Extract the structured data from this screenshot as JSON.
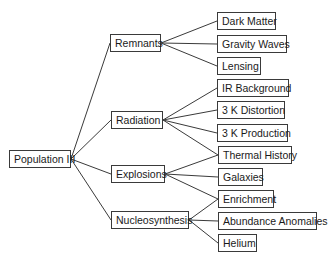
{
  "diagram": {
    "type": "tree",
    "root": {
      "id": "pop3",
      "label": "Population III"
    },
    "nodes": [
      {
        "id": "pop3",
        "label": "Population III",
        "x": 9,
        "y": 150,
        "w": 62
      },
      {
        "id": "remnants",
        "label": "Remnants",
        "x": 110,
        "y": 34,
        "w": 51
      },
      {
        "id": "radiation",
        "label": "Radiation",
        "x": 111,
        "y": 111,
        "w": 52
      },
      {
        "id": "explosions",
        "label": "Explosions",
        "x": 111,
        "y": 165,
        "w": 54
      },
      {
        "id": "nucleosynthesis",
        "label": "Nucleosynthesis",
        "x": 111,
        "y": 211,
        "w": 78
      },
      {
        "id": "dark_matter",
        "label": "Dark Matter",
        "x": 217,
        "y": 12,
        "w": 59
      },
      {
        "id": "gravity_waves",
        "label": "Gravity Waves",
        "x": 217,
        "y": 35,
        "w": 70
      },
      {
        "id": "lensing",
        "label": "Lensing",
        "x": 217,
        "y": 57,
        "w": 44
      },
      {
        "id": "ir_background",
        "label": "IR Background",
        "x": 217,
        "y": 79,
        "w": 72
      },
      {
        "id": "k3_distortion",
        "label": "3 K Distortion",
        "x": 217,
        "y": 101,
        "w": 68
      },
      {
        "id": "k3_production",
        "label": "3 K Production",
        "x": 217,
        "y": 124,
        "w": 71
      },
      {
        "id": "thermal_history",
        "label": "Thermal History",
        "x": 218,
        "y": 146,
        "w": 74
      },
      {
        "id": "galaxies",
        "label": "Galaxies",
        "x": 218,
        "y": 168,
        "w": 45
      },
      {
        "id": "enrichment",
        "label": "Enrichment",
        "x": 218,
        "y": 190,
        "w": 56
      },
      {
        "id": "abundance_anomalies",
        "label": "Abundance Anomalies",
        "x": 218,
        "y": 212,
        "w": 99
      },
      {
        "id": "helium",
        "label": "Helium",
        "x": 218,
        "y": 234,
        "w": 39
      }
    ],
    "edges": [
      [
        "pop3",
        "remnants"
      ],
      [
        "pop3",
        "radiation"
      ],
      [
        "pop3",
        "explosions"
      ],
      [
        "pop3",
        "nucleosynthesis"
      ],
      [
        "remnants",
        "dark_matter"
      ],
      [
        "remnants",
        "gravity_waves"
      ],
      [
        "remnants",
        "lensing"
      ],
      [
        "radiation",
        "ir_background"
      ],
      [
        "radiation",
        "k3_distortion"
      ],
      [
        "radiation",
        "k3_production"
      ],
      [
        "radiation",
        "thermal_history"
      ],
      [
        "explosions",
        "thermal_history"
      ],
      [
        "explosions",
        "galaxies"
      ],
      [
        "explosions",
        "enrichment"
      ],
      [
        "nucleosynthesis",
        "enrichment"
      ],
      [
        "nucleosynthesis",
        "abundance_anomalies"
      ],
      [
        "nucleosynthesis",
        "helium"
      ]
    ],
    "colors": {
      "line": "#3a3a3a",
      "box_border": "#3a3a3a",
      "text": "#1a1a1a",
      "background": "#ffffff"
    }
  }
}
